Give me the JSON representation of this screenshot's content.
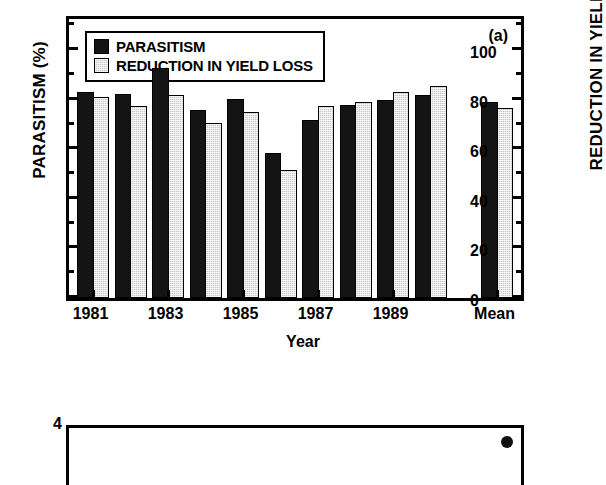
{
  "figure": {
    "panel_a_tag": "(a)",
    "x_axis_title": "Year",
    "y_axis_left_title": "PARASITISM (%)",
    "y_axis_right_title": "REDUCTION IN YIELD LOSS (%)"
  },
  "legend": {
    "items": [
      {
        "label": "PARASITISM",
        "swatch": "dark-filled-square",
        "color": "#141414"
      },
      {
        "label": "REDUCTION IN YIELD LOSS",
        "swatch": "light-hatched-square",
        "color": "#c9c9c9"
      }
    ]
  },
  "axis": {
    "y_major_ticks": [
      "0",
      "20",
      "40",
      "60",
      "80",
      "100"
    ],
    "y_minor_ticks": [
      10,
      30,
      50,
      70,
      90,
      110
    ],
    "x_tick_labels": [
      "1981",
      "1983",
      "1985",
      "1987",
      "1989",
      "Mean"
    ]
  },
  "panel_b": {
    "y_top_label": "4"
  },
  "chart_data": {
    "type": "bar",
    "title": "",
    "subtitle": "",
    "panel": "(a)",
    "xlabel": "Year",
    "ylabel": "PARASITISM (%)",
    "ylabel_right": "REDUCTION IN YIELD LOSS (%)",
    "ylim": [
      0,
      115
    ],
    "y_ticks": [
      0,
      20,
      40,
      60,
      80,
      100
    ],
    "grid": false,
    "legend_position": "top-left",
    "categories": [
      "1981",
      "1982",
      "1983",
      "1984",
      "1985",
      "1986",
      "1987",
      "1988",
      "1989",
      "1990",
      "Mean"
    ],
    "x_tick_labels_shown": [
      "1981",
      "1983",
      "1985",
      "1987",
      "1989",
      "Mean"
    ],
    "series": [
      {
        "name": "PARASITISM",
        "color": "#141414",
        "values": [
          83,
          82.5,
          93,
          76,
          80.5,
          58.5,
          72,
          78,
          80,
          82,
          79
        ]
      },
      {
        "name": "REDUCTION IN YIELD LOSS",
        "color": "#c9c9c9",
        "values": [
          81,
          77.5,
          82,
          70.5,
          75,
          51.5,
          77.5,
          79,
          83,
          85.5,
          76.5
        ]
      }
    ]
  }
}
